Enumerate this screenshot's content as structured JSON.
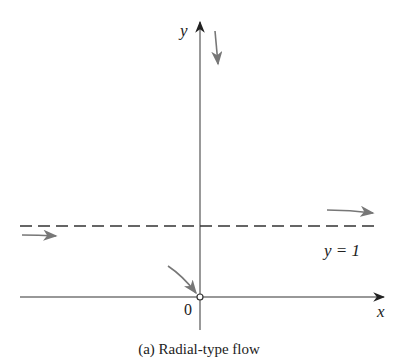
{
  "diagram": {
    "axes": {
      "x_label": "x",
      "y_label": "y",
      "origin_label": "0"
    },
    "asymptote": {
      "label": "y = 1",
      "style": "dashed",
      "value": 1
    },
    "open_point": {
      "x": 0,
      "y": 0,
      "style": "open-circle"
    },
    "flow_arrows": [
      {
        "region": "top-near-y-axis",
        "direction": "down"
      },
      {
        "region": "left-below-asymptote",
        "direction": "right"
      },
      {
        "region": "right-above-asymptote",
        "direction": "right"
      },
      {
        "region": "approaching-origin",
        "direction": "down-right"
      }
    ],
    "caption": "(a) Radial-type flow",
    "colors": {
      "axis": "#333333",
      "arrow": "#777777",
      "dashed": "#333333"
    }
  }
}
